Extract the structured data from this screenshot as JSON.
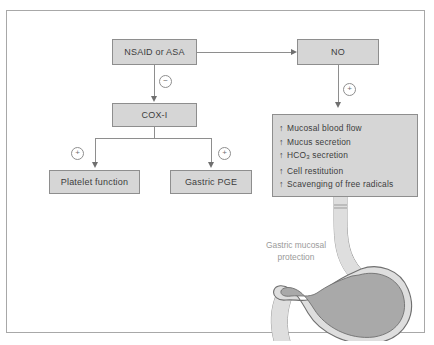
{
  "diagram": {
    "nodes": {
      "nsaid": "NSAID or ASA",
      "no": "NO",
      "cox1": "COX-I",
      "platelet": "Platelet function",
      "gastric_pge": "Gastric PGE"
    },
    "effects_list": [
      {
        "arrow": "↑",
        "text": "Mucosal blood flow"
      },
      {
        "arrow": "↑",
        "text": "Mucus secretion"
      },
      {
        "arrow": "↑",
        "text": "HCO3 secretion",
        "html": "HCO<sub>3</sub> secretion"
      },
      {
        "arrow": "↑",
        "text": "Cell restitution"
      },
      {
        "arrow": "↑",
        "text": "Scavenging of free radicals"
      }
    ],
    "symbols": {
      "inhibit": "−",
      "stimulate": "+"
    },
    "illustration_label": {
      "line1": "Gastric mucosal",
      "line2": "protection"
    },
    "colors": {
      "box_fill": "#d6d6d6",
      "box_border": "#8e8e8e",
      "connector": "#8e8e8e",
      "text": "#3d3d3d",
      "label_text": "#9a9a9a",
      "frame_border": "#a8a8a8",
      "organ_fill": "#a9a9a9",
      "organ_wall": "#d9d9d9"
    }
  }
}
